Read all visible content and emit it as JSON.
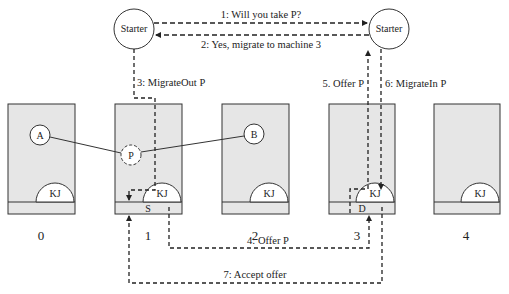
{
  "colors": {
    "machine_fill": "#e6e6e6",
    "stroke": "#333333",
    "circle_fill": "#ffffff"
  },
  "starters": [
    {
      "label": "Starter"
    },
    {
      "label": "Starter"
    }
  ],
  "machines": [
    {
      "number": "0",
      "kernel": "KJ",
      "strip_label": ""
    },
    {
      "number": "1",
      "kernel": "KJ",
      "strip_label": "S"
    },
    {
      "number": "2",
      "kernel": "KJ",
      "strip_label": ""
    },
    {
      "number": "3",
      "kernel": "KJ",
      "strip_label": "D"
    },
    {
      "number": "4",
      "kernel": "KJ",
      "strip_label": ""
    }
  ],
  "processes": {
    "a": "A",
    "b": "B",
    "p": "P"
  },
  "messages": {
    "m1": "1: Will you take P?",
    "m2": "2: Yes, migrate to machine 3",
    "m3": "3: MigrateOut P",
    "m4": "4: Offer P",
    "m5": "5. Offer P",
    "m6": "6: MigrateIn P",
    "m7": "7: Accept offer"
  }
}
